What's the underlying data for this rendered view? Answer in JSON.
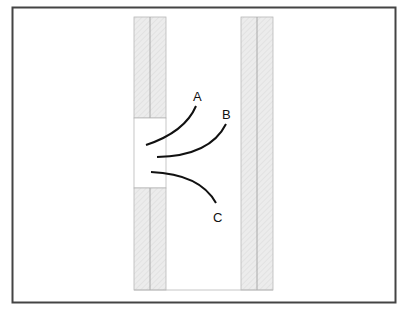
{
  "diagram": {
    "labels": {
      "a": "A",
      "b": "B",
      "c": "C"
    },
    "colors": {
      "frame": "#444444",
      "wall_fill": "#e8e8e8",
      "wall_line": "#b0b0b0",
      "curve": "#111111",
      "background": "#ffffff"
    }
  }
}
